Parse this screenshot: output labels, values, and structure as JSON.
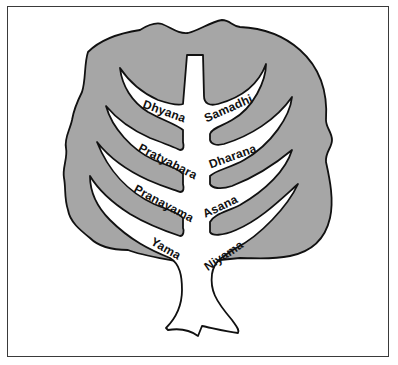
{
  "diagram": {
    "type": "tree",
    "colors": {
      "crown_fill": "#a6a6a6",
      "outline": "#111111",
      "trunk_fill": "#ffffff",
      "frame": "#3a3a3a",
      "background": "#ffffff"
    },
    "branches": {
      "left": [
        {
          "label": "Dhyana"
        },
        {
          "label": "Pratyahara"
        },
        {
          "label": "Pranayama"
        },
        {
          "label": "Yama"
        }
      ],
      "right": [
        {
          "label": "Samadhi"
        },
        {
          "label": "Dharana"
        },
        {
          "label": "Asana"
        },
        {
          "label": "Niyama"
        }
      ]
    }
  }
}
